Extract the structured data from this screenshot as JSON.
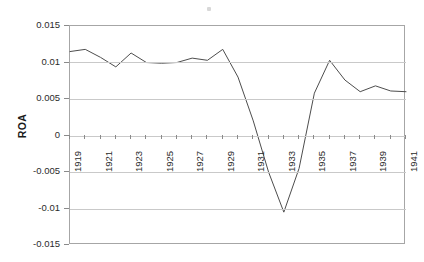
{
  "chart_data": {
    "type": "line",
    "title": "",
    "xlabel": "",
    "ylabel": "ROA",
    "x": [
      1919,
      1920,
      1921,
      1922,
      1923,
      1924,
      1925,
      1926,
      1927,
      1928,
      1929,
      1930,
      1931,
      1932,
      1933,
      1934,
      1935,
      1936,
      1937,
      1938,
      1939,
      1940,
      1941
    ],
    "values": [
      0.0115,
      0.0118,
      0.0107,
      0.0094,
      0.0113,
      0.01,
      0.0099,
      0.01,
      0.0106,
      0.0103,
      0.0118,
      0.008,
      0.002,
      -0.005,
      -0.0105,
      -0.0045,
      0.0058,
      0.0103,
      0.0076,
      0.006,
      0.0068,
      0.0061,
      0.006
    ],
    "series": [
      {
        "name": "ROA",
        "values": [
          0.0115,
          0.0118,
          0.0107,
          0.0094,
          0.0113,
          0.01,
          0.0099,
          0.01,
          0.0106,
          0.0103,
          0.0118,
          0.008,
          0.002,
          -0.005,
          -0.0105,
          -0.0045,
          0.0058,
          0.0103,
          0.0076,
          0.006,
          0.0068,
          0.0061,
          0.006
        ],
        "color": "#4d4d4d"
      }
    ],
    "ylim": [
      -0.015,
      0.015
    ],
    "xlim": [
      1919,
      1941
    ],
    "yticks": [
      0.015,
      0.01,
      0.005,
      0,
      -0.005,
      -0.01,
      -0.015
    ],
    "ytick_labels": [
      "0.015",
      "0.01",
      "0.005",
      "0",
      "-0.005",
      "-0.01",
      "-0.015"
    ],
    "xticks": [
      1919,
      1921,
      1923,
      1925,
      1927,
      1929,
      1931,
      1933,
      1935,
      1937,
      1939,
      1941
    ],
    "xtick_labels": [
      "1919",
      "1921",
      "1923",
      "1925",
      "1927",
      "1929",
      "1931",
      "1933",
      "1935",
      "1937",
      "1939",
      "1941"
    ],
    "grid": true,
    "grid_axis": "y",
    "legend": false,
    "legend_position": "none",
    "line_color": "#4d4d4d",
    "plot_border_color": "#a6a6a6",
    "gridline_color": "#c9c9c9",
    "background_color": "#ffffff"
  }
}
